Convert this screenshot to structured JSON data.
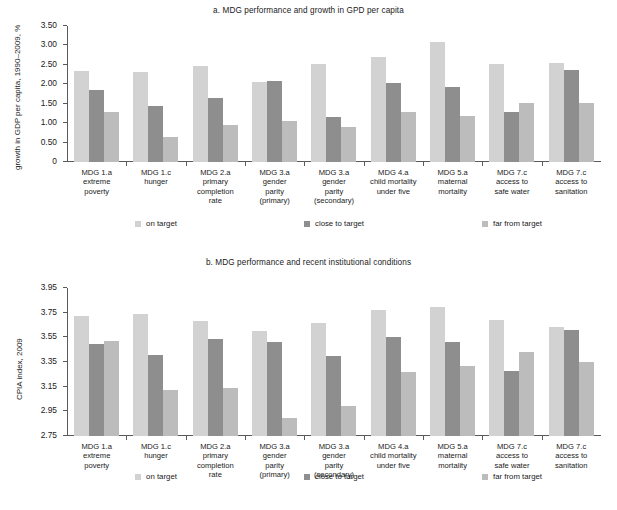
{
  "figure": {
    "series_names": [
      "on target",
      "close to target",
      "far from target"
    ],
    "series_colors": [
      "#d2d2d2",
      "#8e8e8e",
      "#bcbcbc"
    ],
    "categories": [
      [
        "MDG 1.a",
        "extreme",
        "poverty"
      ],
      [
        "MDG 1.c",
        "hunger"
      ],
      [
        "MDG 2.a",
        "primary",
        "completion",
        "rate"
      ],
      [
        "MDG 3.a",
        "gender",
        "parity",
        "(primary)"
      ],
      [
        "MDG 3.a",
        "gender",
        "parity",
        "(secondary)"
      ],
      [
        "MDG 4.a",
        "child mortality",
        "under five"
      ],
      [
        "MDG 5.a",
        "maternal",
        "mortality"
      ],
      [
        "MDG 7.c",
        "access to",
        "safe water"
      ],
      [
        "MDG 7.c",
        "access to",
        "sanitation"
      ]
    ]
  },
  "chart_data": [
    {
      "type": "bar",
      "id": "a",
      "title": "a.  MDG performance and growth in GPD per capita",
      "xlabel": "",
      "ylabel": "growth in GDP per capita, 1990–2009, %",
      "ylim": [
        0,
        3.5
      ],
      "yticks": [
        "0",
        "0.50",
        "1.00",
        "1.50",
        "2.00",
        "2.50",
        "3.00",
        "3.50"
      ],
      "ytick_values": [
        0,
        0.5,
        1.0,
        1.5,
        2.0,
        2.5,
        3.0,
        3.5
      ],
      "grid": false,
      "legend_position": "bottom",
      "categories": [
        "MDG 1.a extreme poverty",
        "MDG 1.c hunger",
        "MDG 2.a primary completion rate",
        "MDG 3.a gender parity (primary)",
        "MDG 3.a gender parity (secondary)",
        "MDG 4.a child mortality under five",
        "MDG 5.a maternal mortality",
        "MDG 7.c access to safe water",
        "MDG 7.c access to sanitation"
      ],
      "series": [
        {
          "name": "on target",
          "values": [
            2.33,
            2.31,
            2.46,
            2.06,
            2.52,
            2.71,
            3.1,
            2.52,
            2.56
          ]
        },
        {
          "name": "close to target",
          "values": [
            1.85,
            1.44,
            1.65,
            2.08,
            1.17,
            2.04,
            1.93,
            1.3,
            2.37
          ]
        },
        {
          "name": "far from target",
          "values": [
            1.29,
            0.65,
            0.96,
            1.05,
            0.9,
            1.3,
            1.18,
            1.52,
            1.52
          ]
        }
      ]
    },
    {
      "type": "bar",
      "id": "b",
      "title": "b.  MDG performance and recent institutional conditions",
      "xlabel": "",
      "ylabel": "CPIA index, 2009",
      "ylim": [
        2.75,
        3.95
      ],
      "yticks": [
        "2.75",
        "2.95",
        "3.15",
        "3.35",
        "3.55",
        "3.75",
        "3.95"
      ],
      "ytick_values": [
        2.75,
        2.95,
        3.15,
        3.35,
        3.55,
        3.75,
        3.95
      ],
      "grid": false,
      "legend_position": "bottom",
      "categories": [
        "MDG 1.a extreme poverty",
        "MDG 1.c hunger",
        "MDG 2.a primary completion rate",
        "MDG 3.a gender parity (primary)",
        "MDG 3.a gender parity (secondary)",
        "MDG 4.a child mortality under five",
        "MDG 5.a maternal mortality",
        "MDG 7.c access to safe water",
        "MDG 7.c access to sanitation"
      ],
      "series": [
        {
          "name": "on target",
          "values": [
            3.72,
            3.74,
            3.68,
            3.6,
            3.67,
            3.77,
            3.8,
            3.69,
            3.63
          ]
        },
        {
          "name": "close to target",
          "values": [
            3.5,
            3.41,
            3.54,
            3.51,
            3.4,
            3.55,
            3.51,
            3.28,
            3.61
          ]
        },
        {
          "name": "far from target",
          "values": [
            3.52,
            3.12,
            3.14,
            2.9,
            2.99,
            3.27,
            3.32,
            3.43,
            3.35
          ]
        }
      ]
    }
  ]
}
